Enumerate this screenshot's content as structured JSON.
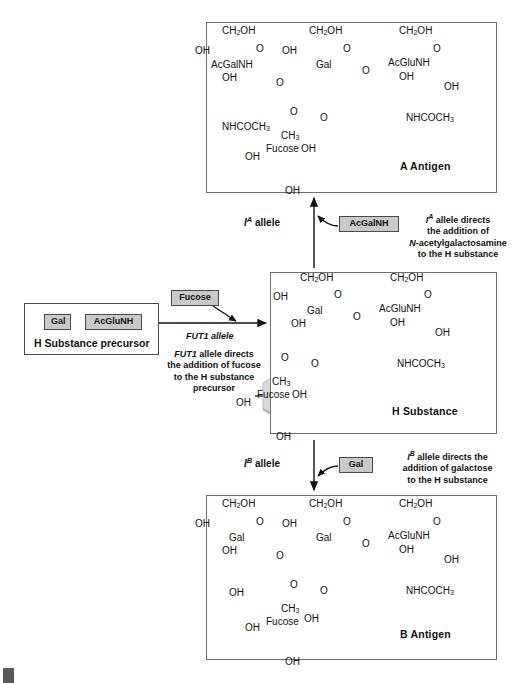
{
  "figure": {
    "type": "pathway-diagram",
    "corner_mark": "dark-square-marker"
  },
  "precursor": {
    "title": "H Substance precursor",
    "sugars": [
      "Gal",
      "AcGluNH"
    ]
  },
  "steps": {
    "fut1": {
      "chip": "Fucose",
      "gene": "FUT1 allele",
      "description_lines": [
        "FUT1 allele directs",
        "the addition of fucose",
        "to the H substance",
        "precursor"
      ]
    },
    "ia": {
      "allele_label": "allele",
      "allele_symbol": "I",
      "allele_superscript": "A",
      "chip": "AcGalNH",
      "description_lines": [
        "I A allele directs",
        "the addition of",
        "N-acetylgalactosamine",
        "to the H substance"
      ]
    },
    "ib": {
      "allele_label": "allele",
      "allele_symbol": "I",
      "allele_superscript": "B",
      "chip": "Gal",
      "description_lines": [
        "I B allele directs the",
        "addition of galactose",
        "to the H substance"
      ]
    }
  },
  "panels": {
    "a_antigen": {
      "title": "A Antigen",
      "rings": [
        {
          "name": "AcGalNH",
          "shade": "#ebebeb"
        },
        {
          "name": "Gal",
          "shade": "#c6c6c6"
        },
        {
          "name": "AcGluNH",
          "shade": "#9a9a9a"
        },
        {
          "name": "Fucose",
          "shade": "#d8d8d8"
        }
      ],
      "substituents": [
        "CH2OH",
        "OH",
        "O",
        "NHCOCH3",
        "CH3"
      ]
    },
    "h_substance": {
      "title": "H Substance",
      "rings": [
        {
          "name": "Gal",
          "shade": "#c6c6c6"
        },
        {
          "name": "AcGluNH",
          "shade": "#9a9a9a"
        },
        {
          "name": "Fucose",
          "shade": "#d8d8d8"
        }
      ],
      "substituents": [
        "CH2OH",
        "OH",
        "O",
        "NHCOCH3",
        "CH3"
      ]
    },
    "b_antigen": {
      "title": "B Antigen",
      "rings": [
        {
          "name": "Gal",
          "shade": "#c6c6c6"
        },
        {
          "name": "Gal",
          "shade": "#c6c6c6"
        },
        {
          "name": "AcGluNH",
          "shade": "#9a9a9a"
        },
        {
          "name": "Fucose",
          "shade": "#d8d8d8"
        }
      ],
      "substituents": [
        "CH2OH",
        "OH",
        "O",
        "NHCOCH3",
        "CH3"
      ]
    }
  },
  "atoms": {
    "ch2oh": "CH",
    "ch2oh_sub": "2",
    "ch2oh_tail": "OH",
    "oh": "OH",
    "o": "O",
    "nhcoch3": "NHCOCH",
    "nhcoch3_sub": "3",
    "ch3": "CH",
    "ch3_sub": "3"
  },
  "colors": {
    "ring_light": "#ebebeb",
    "ring_mid": "#c6c6c6",
    "ring_dark": "#9a9a9a",
    "ring_fucose": "#d8d8d8",
    "chip_fill": "#c9c9c9",
    "panel_border": "#6d6f72",
    "line": "#111111"
  }
}
